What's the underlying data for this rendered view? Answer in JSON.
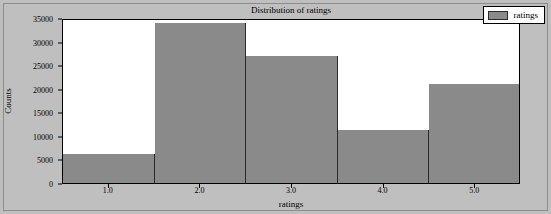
{
  "chart_data": {
    "type": "bar",
    "title": "Distribution of ratings",
    "xlabel": "ratings",
    "ylabel": "Counts",
    "categories": [
      "1.0",
      "2.0",
      "3.0",
      "4.0",
      "5.0"
    ],
    "values": [
      6200,
      34000,
      27000,
      11300,
      21000
    ],
    "bin_edges": [
      0.5,
      1.5,
      2.5,
      3.5,
      4.5,
      5.5
    ],
    "xlim": [
      0.5,
      5.5
    ],
    "ylim": [
      0,
      35000
    ],
    "xticks": [
      "1.0",
      "2.0",
      "3.0",
      "4.0",
      "5.0"
    ],
    "xtick_values": [
      1.0,
      2.0,
      3.0,
      4.0,
      5.0
    ],
    "yticks": [
      "0",
      "5000",
      "10000",
      "15000",
      "20000",
      "25000",
      "30000",
      "35000"
    ],
    "ytick_values": [
      0,
      5000,
      10000,
      15000,
      20000,
      25000,
      30000,
      35000
    ],
    "grid": false,
    "legend_position": "upper right",
    "series": [
      {
        "name": "ratings",
        "values": [
          6200,
          34000,
          27000,
          11300,
          21000
        ]
      }
    ],
    "colors": {
      "bar_fill": "#8a8a8a",
      "bar_edge": "#2b2b2b",
      "figure_background": "#bfbfbf",
      "axes_background": "#ffffff",
      "axis_line": "#000000",
      "text": "#000000"
    }
  },
  "legend": {
    "entries": [
      {
        "label": "ratings",
        "swatch_color": "#8a8a8a"
      }
    ]
  }
}
